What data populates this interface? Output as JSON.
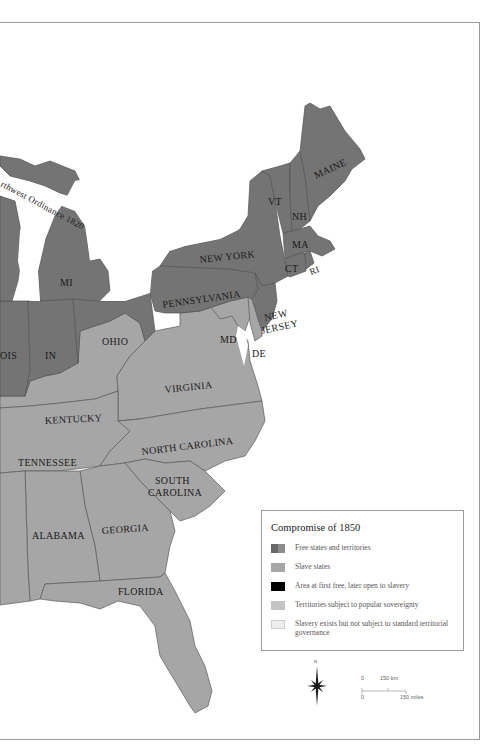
{
  "map": {
    "colors": {
      "free": "#747474",
      "slave": "#a6a6a6",
      "closed_to_slavery_later_open": "#000000",
      "popular_sovereignty": "#c4c4c4",
      "unorganized": "#ececec",
      "water": "#ffffff",
      "border": "#555555"
    },
    "labels": {
      "maine": "MAINE",
      "vt": "VT",
      "nh": "NH",
      "ma": "MA",
      "ct": "CT",
      "ri": "RI",
      "new_york": "NEW YORK",
      "pennsylvania": "PENNSYLVANIA",
      "new_jersey_1": "NEW",
      "new_jersey_2": "JERSEY",
      "md": "MD",
      "de": "DE",
      "mi": "MI",
      "ohio": "OHIO",
      "in": "IN",
      "illinois_partial": "OIS",
      "kentucky": "KENTUCKY",
      "virginia": "VIRGINIA",
      "tennessee": "TENNESSEE",
      "north_carolina": "NORTH CAROLINA",
      "south_carolina_1": "SOUTH",
      "south_carolina_2": "CAROLINA",
      "alabama": "ALABAMA",
      "georgia": "GEORGIA",
      "florida": "FLORIDA",
      "northwest_ordinance": "rthwest Ordinance 1820"
    }
  },
  "legend": {
    "title": "Compromise of 1850",
    "items": [
      {
        "label": "Free states and territories",
        "swatch": "free"
      },
      {
        "label": "Slave states",
        "swatch": "slave"
      },
      {
        "label": "Area at first free, later open to slavery",
        "swatch": "black"
      },
      {
        "label": "Territories subject to popular sovereignty",
        "swatch": "popular"
      },
      {
        "label": "Slavery exists but not subject to standard territorial governance",
        "swatch": "unorganized"
      }
    ]
  },
  "compass": {
    "north_label": "N"
  },
  "scale": {
    "km_zero": "0",
    "km_label": "150 km",
    "mi_zero": "0",
    "mi_label": "150 miles"
  }
}
